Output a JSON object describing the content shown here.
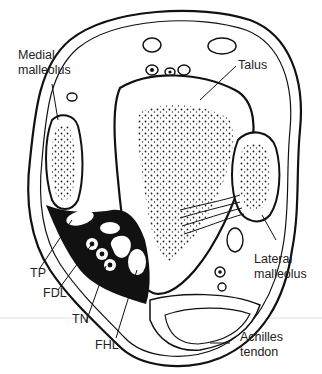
{
  "figure": {
    "labels": {
      "medial_malleolus_line1": "Medial",
      "medial_malleolus_line2": "malleolus",
      "talus": "Talus",
      "lateral_malleolus_line1": "Lateral",
      "lateral_malleolus_line2": "malleolus",
      "tp": "TP",
      "fdl": "FDL",
      "tn": "TN",
      "fhl": "FHL",
      "achilles_line1": "Achilles",
      "achilles_line2": "tendon"
    },
    "colors": {
      "ink": "#111111",
      "background": "#ffffff",
      "guide_line": "#d8d8d8"
    }
  }
}
